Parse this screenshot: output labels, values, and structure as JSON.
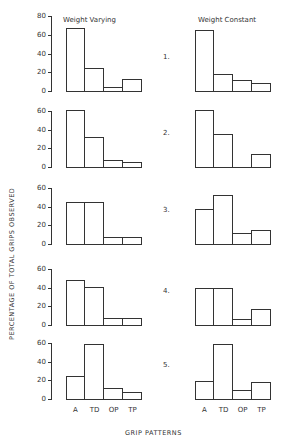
{
  "chart_data": {
    "type": "bar",
    "ylabel": "PERCENTAGE OF TOTAL GRIPS OBSERVED",
    "xlabel": "GRIP PATTERNS",
    "categories": [
      "A",
      "TD",
      "OP",
      "TP"
    ],
    "column_titles": [
      "Weight Varying",
      "Weight Constant"
    ],
    "yticks": [
      0,
      20,
      40,
      60,
      80
    ],
    "ylim": [
      0,
      80
    ],
    "grid": false,
    "panels": [
      {
        "label": "1.",
        "yticks": [
          0,
          20,
          40,
          60,
          80
        ],
        "series": [
          {
            "name": "Weight Varying",
            "values": [
              67,
              25,
              4,
              13
            ]
          },
          {
            "name": "Weight Constant",
            "values": [
              65,
              18,
              12,
              9
            ]
          }
        ]
      },
      {
        "label": "2.",
        "yticks": [
          0,
          20,
          40,
          60
        ],
        "series": [
          {
            "name": "Weight Varying",
            "values": [
              61,
              32,
              8,
              5
            ]
          },
          {
            "name": "Weight Constant",
            "values": [
              61,
              35,
              0,
              14
            ]
          }
        ]
      },
      {
        "label": "3.",
        "yticks": [
          0,
          20,
          40,
          60
        ],
        "series": [
          {
            "name": "Weight Varying",
            "values": [
              45,
              45,
              7,
              7
            ]
          },
          {
            "name": "Weight Constant",
            "values": [
              38,
              52,
              12,
              15
            ]
          }
        ]
      },
      {
        "label": "4.",
        "yticks": [
          0,
          20,
          40,
          60
        ],
        "series": [
          {
            "name": "Weight Varying",
            "values": [
              48,
              41,
              7,
              7
            ]
          },
          {
            "name": "Weight Constant",
            "values": [
              40,
              40,
              6,
              17
            ]
          }
        ]
      },
      {
        "label": "5.",
        "yticks": [
          0,
          20,
          40,
          60
        ],
        "series": [
          {
            "name": "Weight Varying",
            "values": [
              25,
              59,
              12,
              7
            ]
          },
          {
            "name": "Weight Constant",
            "values": [
              19,
              59,
              10,
              18
            ]
          }
        ]
      }
    ]
  }
}
